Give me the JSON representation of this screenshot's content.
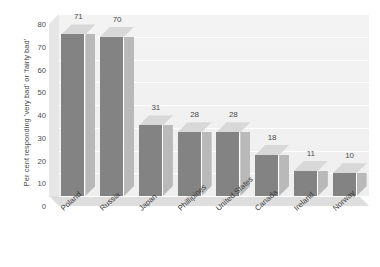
{
  "chart_data": {
    "type": "bar",
    "title": "",
    "subtitle": "",
    "xlabel": "",
    "ylabel": "Per cent responding 'very bad' or 'fairly bad'",
    "categories": [
      "Poland",
      "Russia",
      "Japan",
      "Phillipines",
      "United States",
      "Canada",
      "Ireland",
      "Norway"
    ],
    "values": [
      71,
      70,
      31,
      28,
      28,
      18,
      11,
      10
    ],
    "data_labels": [
      "71",
      "70",
      "31",
      "28",
      "28",
      "18",
      "11",
      "10"
    ],
    "ylim": [
      0,
      80
    ],
    "ytick_labels": [
      "0",
      "10",
      "20",
      "30",
      "40",
      "50",
      "60",
      "70",
      "80"
    ],
    "ytick_values": [
      0,
      10,
      20,
      30,
      40,
      50,
      60,
      70,
      80
    ],
    "grid": true,
    "legend": false,
    "legend_position": "none",
    "style_3d": true,
    "annotations": []
  },
  "colors": {
    "bar_front": "#838383",
    "bar_side": "#b9b9b9",
    "bar_top": "#d8d8d8",
    "wall": "#f0f0f0",
    "floor": "#dedede",
    "gridline": "#ffffff",
    "text": "#4a4a4a",
    "background": "#ffffff"
  }
}
